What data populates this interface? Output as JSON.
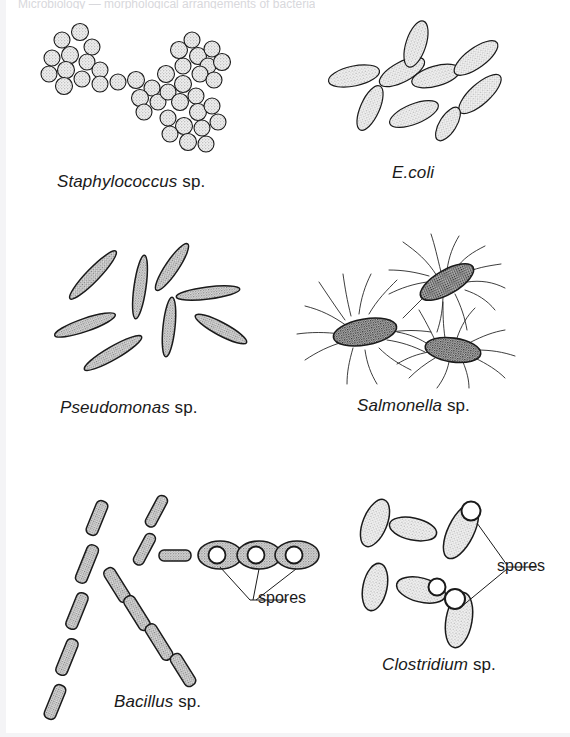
{
  "figure": {
    "title_cropped": "Microbiology — morphological arrangements of bacteria",
    "background_color": "#ffffff",
    "ink_color": "#1a1a1a",
    "fill_color": "#e8e8e8"
  },
  "panels": [
    {
      "id": "staphylococcus",
      "genus": "Staphylococcus",
      "sp": " sp.",
      "shape": "coccus",
      "arrangement": "irregular grape-like clusters",
      "cell_count": 43,
      "has_flagella": false,
      "has_spores": false,
      "caption_x": 57,
      "caption_y": 172
    },
    {
      "id": "ecoli",
      "genus": "E.coli",
      "sp": "",
      "shape": "bacillus",
      "arrangement": "single scattered rods",
      "cell_count": 9,
      "has_flagella": false,
      "has_spores": false,
      "caption_x": 392,
      "caption_y": 163
    },
    {
      "id": "pseudomonas",
      "genus": "Pseudomonas",
      "sp": " sp.",
      "shape": "slender bacillus",
      "arrangement": "single scattered thin rods",
      "cell_count": 9,
      "has_flagella": false,
      "has_spores": false,
      "caption_x": 60,
      "caption_y": 398
    },
    {
      "id": "salmonella",
      "genus": "Salmonella",
      "sp": " sp.",
      "shape": "bacillus",
      "arrangement": "rods with peritrichous flagella",
      "cell_count": 3,
      "has_flagella": true,
      "has_spores": false,
      "caption_x": 357,
      "caption_y": 396
    },
    {
      "id": "bacillus",
      "genus": "Bacillus",
      "sp": " sp.",
      "shape": "bacillus",
      "arrangement": "chains (streptobacilli) and endospore-bearing cells",
      "cell_count": 18,
      "has_flagella": false,
      "has_spores": true,
      "spore_count": 3,
      "caption_x": 114,
      "caption_y": 692
    },
    {
      "id": "clostridium",
      "genus": "Clostridium",
      "sp": " sp.",
      "shape": "bacillus",
      "arrangement": "rods with terminal and subterminal endospores",
      "cell_count": 6,
      "has_flagella": false,
      "has_spores": true,
      "spore_count": 3,
      "caption_x": 382,
      "caption_y": 655
    }
  ],
  "annotations": [
    {
      "id": "bacillus-spores",
      "label": "spores",
      "x": 258,
      "y": 592
    },
    {
      "id": "clostridium-spores",
      "label": "spores",
      "x": 468,
      "y": 570
    }
  ]
}
